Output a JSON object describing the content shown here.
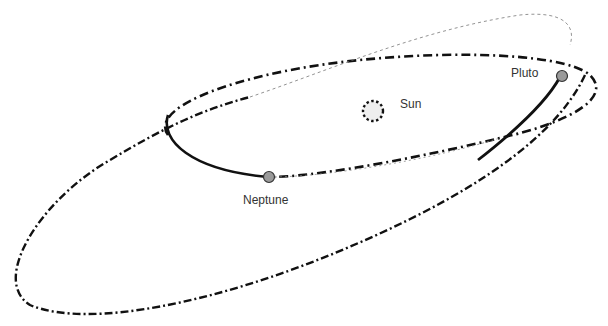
{
  "diagram": {
    "labels": {
      "sun": "Sun",
      "pluto": "Pluto",
      "neptune": "Neptune"
    },
    "colors": {
      "orbit_line": "#111111",
      "body_fill": "#9a9a9a",
      "sun_fill": "#eeeeee",
      "background": "#ffffff"
    }
  }
}
